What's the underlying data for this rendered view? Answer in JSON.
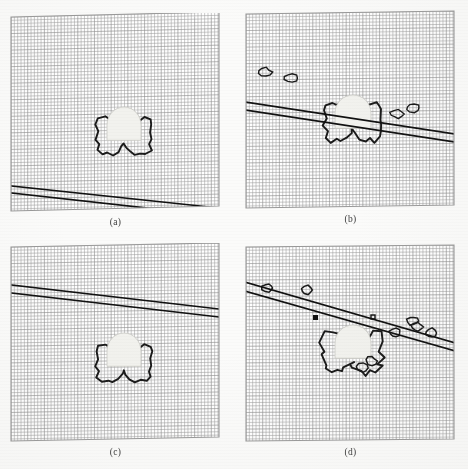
{
  "figure": {
    "kind": "scanned-scientific-figure",
    "background_color": "#fbfbfa",
    "mesh_color": "#8e8e8e",
    "contour_color": "#1a1a1a",
    "line_color": "#111111",
    "inclusion_fill": "#f2f2ee",
    "panel_border_color": "#9a9a9a",
    "caption_color": "#3a3a3a"
  },
  "panels": [
    {
      "id": "a",
      "caption": "(a)",
      "x": 10,
      "y": 13,
      "w": 211,
      "h": 200,
      "skew_top_dy": -5,
      "mesh_cols": 62,
      "mesh_rows": 58,
      "shape": {
        "name": "bowtie-contour",
        "cx": 114,
        "cy": 123,
        "scale": 1.0,
        "roughness": "smooth"
      },
      "inclusion": {
        "cx": 114,
        "cy": 112,
        "rx": 17,
        "ry": 18
      },
      "bands": [
        {
          "name": "band-upper",
          "x1": 2,
          "y1": 173,
          "x2": 209,
          "y2": 195
        },
        {
          "name": "band-lower",
          "x1": 2,
          "y1": 180,
          "x2": 209,
          "y2": 203
        }
      ],
      "band_position": "lower-left, below inclusion"
    },
    {
      "id": "b",
      "caption": "(b)",
      "x": 245,
      "y": 10,
      "w": 211,
      "h": 200,
      "skew_top_dy": -3,
      "mesh_cols": 62,
      "mesh_rows": 58,
      "shape": {
        "name": "bowtie-contour-distorted",
        "cx": 108,
        "cy": 112,
        "scale": 1.05,
        "roughness": "jagged"
      },
      "inclusion": {
        "cx": 108,
        "cy": 103,
        "rx": 18,
        "ry": 18
      },
      "bands": [
        {
          "name": "band-upper",
          "x1": 0,
          "y1": 92,
          "x2": 210,
          "y2": 124
        },
        {
          "name": "band-lower",
          "x1": 0,
          "y1": 100,
          "x2": 210,
          "y2": 132
        }
      ],
      "band_position": "through inclusion center"
    },
    {
      "id": "c",
      "caption": "(c)",
      "x": 10,
      "y": 243,
      "w": 211,
      "h": 200,
      "skew_top_dy": -4,
      "mesh_cols": 62,
      "mesh_rows": 58,
      "shape": {
        "name": "bowtie-contour",
        "cx": 114,
        "cy": 120,
        "scale": 1.0,
        "roughness": "smooth"
      },
      "inclusion": {
        "cx": 114,
        "cy": 108,
        "rx": 17,
        "ry": 18
      },
      "bands": [
        {
          "name": "band-upper",
          "x1": 2,
          "y1": 42,
          "x2": 209,
          "y2": 66
        },
        {
          "name": "band-lower",
          "x1": 2,
          "y1": 50,
          "x2": 209,
          "y2": 74
        }
      ],
      "band_position": "upper-left, above inclusion"
    },
    {
      "id": "d",
      "caption": "(d)",
      "x": 245,
      "y": 243,
      "w": 211,
      "h": 200,
      "skew_top_dy": -2,
      "mesh_cols": 62,
      "mesh_rows": 58,
      "shape": {
        "name": "bowtie-contour-spiked",
        "cx": 108,
        "cy": 110,
        "scale": 1.1,
        "roughness": "very-jagged"
      },
      "inclusion": {
        "cx": 108,
        "cy": 100,
        "rx": 18,
        "ry": 18
      },
      "bands": [
        {
          "name": "band-upper",
          "x1": 0,
          "y1": 39,
          "x2": 210,
          "y2": 100
        },
        {
          "name": "band-lower",
          "x1": 0,
          "y1": 48,
          "x2": 210,
          "y2": 108
        }
      ],
      "band_position": "through inclusion, with trailing voids"
    }
  ],
  "captions": {
    "a": "(a)",
    "b": "(b)",
    "c": "(c)",
    "d": "(d)"
  }
}
